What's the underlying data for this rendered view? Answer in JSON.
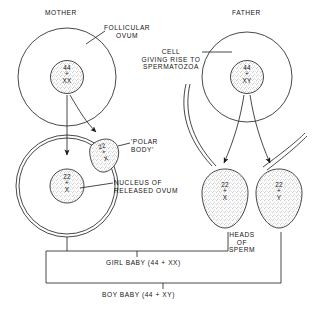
{
  "figure": {
    "title_mother": "MOTHER",
    "title_father": "FATHER",
    "labels": {
      "follicular_ovum": "FOLLICULAR\nOVUM",
      "cell_giving_rise": "CELL\nGIVING RISE TO\nSPERMATOZOA",
      "polar_body": "'POLAR\nBODY'",
      "nucleus_released_ovum": "NUCLEUS OF\nRELEASED OVUM",
      "heads_of_sperm": "HEADS\nOF\nSPERM",
      "girl_baby": "GIRL BABY (44 + XX)",
      "boy_baby": "BOY BABY (44 + XY)"
    },
    "cells": {
      "mother_nucleus": {
        "count": "44",
        "plus": "+",
        "chromosomes": "XX"
      },
      "father_nucleus": {
        "count": "44",
        "plus": "+",
        "chromosomes": "XY"
      },
      "polar_body_nucleus": {
        "count": "22",
        "plus": "+",
        "chromosomes": "X"
      },
      "ovum_nucleus": {
        "count": "22",
        "plus": "+",
        "chromosomes": "X"
      },
      "sperm_x_nucleus": {
        "count": "22",
        "plus": "+",
        "chromosomes": "X"
      },
      "sperm_y_nucleus": {
        "count": "22",
        "plus": "+",
        "chromosomes": "Y"
      }
    },
    "colors": {
      "ink": "#1a1a1a",
      "background": "#ffffff",
      "stipple": "#555555"
    }
  }
}
